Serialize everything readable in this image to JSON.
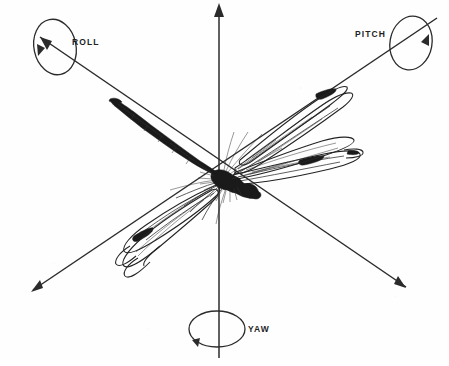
{
  "figure": {
    "background_color": "#fefefe",
    "ink_color": "#1f1f1f",
    "width": 449,
    "height": 366
  },
  "axes": [
    {
      "id": "roll",
      "label": "ROLL",
      "description": "Longitudinal axis running from lower-right to upper-left through the dragonfly body",
      "label_position": {
        "x": 72,
        "y": 45
      },
      "arrow_ends": [
        "upper-left",
        "lower-right"
      ],
      "rotation_marker": "ellipse-with-arrow"
    },
    {
      "id": "pitch",
      "label": "PITCH",
      "description": "Lateral axis running from lower-left to upper-right through the wings",
      "label_position": {
        "x": 355,
        "y": 37
      },
      "arrow_ends": [
        "upper-right",
        "lower-left"
      ],
      "rotation_marker": "ellipse-with-arrow"
    },
    {
      "id": "yaw",
      "label": "YAW",
      "description": "Vertical axis running top to bottom through the dragonfly thorax",
      "label_position": {
        "x": 248,
        "y": 332
      },
      "arrow_ends": [
        "top"
      ],
      "rotation_marker": "ellipse-with-arrow"
    }
  ],
  "subject": {
    "name": "dragonfly",
    "orientation": "body aligned along the roll axis, head toward lower-right, abdomen toward upper-left",
    "parts": [
      "abdomen",
      "thorax",
      "head",
      "forewings",
      "hindwings",
      "legs"
    ]
  },
  "origin": {
    "x": 219,
    "y": 178
  }
}
